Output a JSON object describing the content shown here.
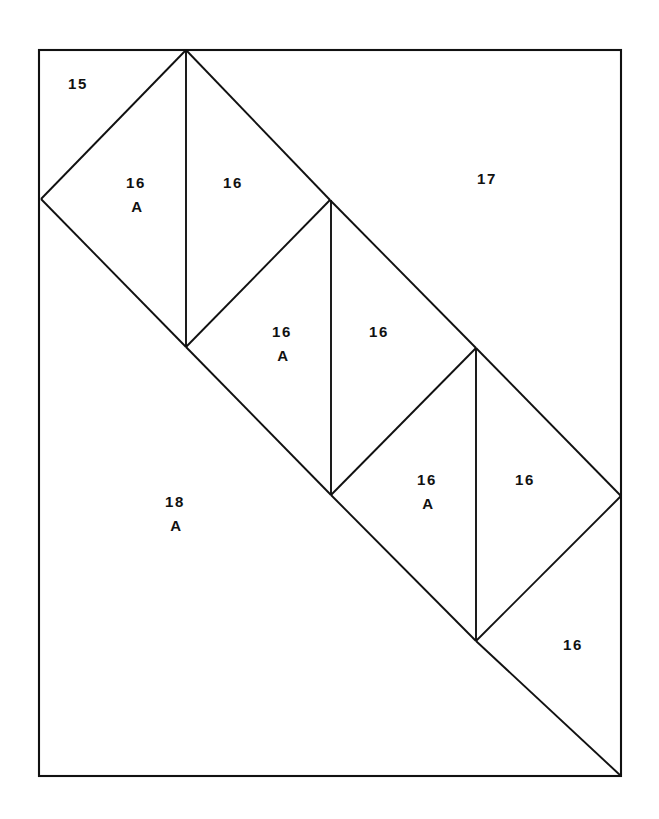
{
  "figure": {
    "background_color": "#ffffff",
    "line_color": "#111111",
    "canvas": {
      "width": 659,
      "height": 819
    }
  },
  "frame": {
    "name": "outer-border",
    "x": 39,
    "y": 50,
    "width": 582,
    "height": 726
  },
  "geometry": {
    "description": "Three diamonds in a descending stair along a main diagonal, each split by a vertical center line, plus a fourth partial diamond at lower right.",
    "vertices": {
      "apex_top": [
        186,
        50
      ],
      "left_mid": [
        41,
        199
      ],
      "d1_bottom": [
        186,
        347
      ],
      "d1_right": [
        330,
        200
      ],
      "d2_bottom": [
        331,
        495
      ],
      "d2_right": [
        476,
        348
      ],
      "d3_bottom": [
        476,
        641
      ],
      "d3_right": [
        621,
        496
      ],
      "frame_bottom_right": [
        621,
        776
      ]
    },
    "lines": [
      {
        "name": "diag-apex-to-left",
        "x1": 186,
        "y1": 50,
        "x2": 41,
        "y2": 199
      },
      {
        "name": "diag-left-to-d1bottom",
        "x1": 41,
        "y1": 199,
        "x2": 186,
        "y2": 347
      },
      {
        "name": "diag-apex-to-d1right",
        "x1": 186,
        "y1": 50,
        "x2": 330,
        "y2": 200
      },
      {
        "name": "vertical-d1-center",
        "x1": 186,
        "y1": 50,
        "x2": 186,
        "y2": 347
      },
      {
        "name": "diag-d1right-to-d2bottom",
        "x1": 330,
        "y1": 200,
        "x2": 186,
        "y2": 347
      },
      {
        "name": "diag-d1right-to-d2right",
        "x1": 330,
        "y1": 200,
        "x2": 476,
        "y2": 348
      },
      {
        "name": "vertical-d2-center",
        "x1": 331,
        "y1": 200,
        "x2": 331,
        "y2": 495
      },
      {
        "name": "diag-d2bottom-left",
        "x1": 186,
        "y1": 347,
        "x2": 331,
        "y2": 495
      },
      {
        "name": "diag-d2right-to-d3bottom",
        "x1": 476,
        "y1": 348,
        "x2": 331,
        "y2": 495
      },
      {
        "name": "diag-d2right-to-d3right",
        "x1": 476,
        "y1": 348,
        "x2": 621,
        "y2": 496
      },
      {
        "name": "vertical-d3-center",
        "x1": 476,
        "y1": 348,
        "x2": 476,
        "y2": 641
      },
      {
        "name": "diag-d3bottom-left",
        "x1": 331,
        "y1": 495,
        "x2": 476,
        "y2": 641
      },
      {
        "name": "diag-d3right-to-d3bottom",
        "x1": 621,
        "y1": 496,
        "x2": 476,
        "y2": 641
      },
      {
        "name": "main-diagonal-lower",
        "x1": 476,
        "y1": 641,
        "x2": 621,
        "y2": 776
      }
    ]
  },
  "labels": [
    {
      "name": "label-15",
      "number": "15",
      "suffix": "",
      "x": 78,
      "y": 85
    },
    {
      "name": "label-16a-first",
      "number": "16",
      "suffix": "A",
      "x": 136,
      "y": 184
    },
    {
      "name": "label-16-first",
      "number": "16",
      "suffix": "",
      "x": 233,
      "y": 184
    },
    {
      "name": "label-17",
      "number": "17",
      "suffix": "",
      "x": 487,
      "y": 180
    },
    {
      "name": "label-16a-second",
      "number": "16",
      "suffix": "A",
      "x": 282,
      "y": 333
    },
    {
      "name": "label-16-second",
      "number": "16",
      "suffix": "",
      "x": 379,
      "y": 333
    },
    {
      "name": "label-18a",
      "number": "18",
      "suffix": "A",
      "x": 175,
      "y": 503
    },
    {
      "name": "label-16a-third",
      "number": "16",
      "suffix": "A",
      "x": 427,
      "y": 481
    },
    {
      "name": "label-16-third",
      "number": "16",
      "suffix": "",
      "x": 525,
      "y": 481
    },
    {
      "name": "label-16-fourth",
      "number": "16",
      "suffix": "",
      "x": 573,
      "y": 646
    }
  ]
}
